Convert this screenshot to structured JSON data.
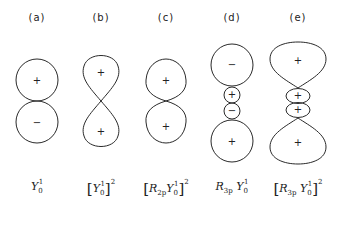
{
  "panels": [
    {
      "id": "a",
      "label": "(a)",
      "x": 37,
      "formula": {
        "prefix": "",
        "radial": "",
        "radial_sub": "",
        "Y": "Y",
        "Y_sub": "0",
        "Y_sup": "1",
        "bracket": false,
        "power": ""
      },
      "lobes": [
        {
          "sign": "+"
        },
        {
          "sign": "−"
        }
      ]
    },
    {
      "id": "b",
      "label": "(b)",
      "x": 101,
      "formula": {
        "radial": "",
        "radial_sub": "",
        "Y": "Y",
        "Y_sub": "0",
        "Y_sup": "1",
        "bracket": true,
        "power": "2"
      },
      "lobes": [
        {
          "sign": "+"
        },
        {
          "sign": "+"
        }
      ]
    },
    {
      "id": "c",
      "label": "(c)",
      "x": 166,
      "formula": {
        "radial": "R",
        "radial_sub": "2p",
        "Y": "Y",
        "Y_sub": "0",
        "Y_sup": "1",
        "bracket": true,
        "power": "2"
      },
      "lobes": [
        {
          "sign": "+"
        },
        {
          "sign": "+"
        }
      ]
    },
    {
      "id": "d",
      "label": "(d)",
      "x": 232,
      "formula": {
        "radial": "R",
        "radial_sub": "3p",
        "Y": "Y",
        "Y_sub": "0",
        "Y_sup": "1",
        "bracket": false,
        "power": ""
      },
      "lobes": [
        {
          "sign": "−"
        },
        {
          "sign": "+"
        },
        {
          "sign": "−"
        },
        {
          "sign": "+"
        }
      ]
    },
    {
      "id": "e",
      "label": "(e)",
      "x": 298,
      "formula": {
        "radial": "R",
        "radial_sub": "3p",
        "Y": "Y",
        "Y_sub": "0",
        "Y_sup": "1",
        "bracket": true,
        "power": "2"
      },
      "lobes": [
        {
          "sign": "+"
        },
        {
          "sign": "+"
        },
        {
          "sign": "+"
        },
        {
          "sign": "+"
        }
      ]
    }
  ],
  "colors": {
    "line": "#2a2a2a",
    "background": "#ffffff"
  }
}
